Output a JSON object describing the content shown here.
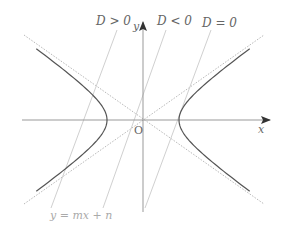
{
  "diagram": {
    "labels": {
      "d_pos": "D > 0",
      "d_neg": "D < 0",
      "d_zero": "D = 0",
      "line_eq": "y = mx + n",
      "origin": "O",
      "x_axis": "x",
      "y_axis": "y"
    },
    "colors": {
      "curve": "#555555",
      "axis": "#888888",
      "asymptote": "#bbbbbb",
      "secant": "#cccccc",
      "text": "#666666",
      "faint_text": "#aaaaaa"
    },
    "geometry": {
      "origin": [
        143,
        120
      ],
      "a": 36,
      "asymptote_slope": 0.71,
      "lines": [
        {
          "name": "D > 0",
          "top": [
            117,
            30
          ],
          "bottom": [
            51,
            208
          ]
        },
        {
          "name": "D < 0",
          "top": [
            166,
            30
          ],
          "bottom": [
            103,
            208
          ]
        },
        {
          "name": "D = 0",
          "top": [
            211,
            30
          ],
          "bottom": [
            145,
            208
          ]
        }
      ]
    }
  }
}
